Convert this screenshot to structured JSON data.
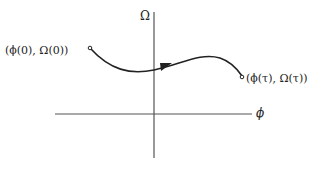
{
  "diagram": {
    "type": "phase-plane trajectory",
    "axes": {
      "x_label": "ϕ",
      "y_label": "Ω"
    },
    "start_point": {
      "label": "(ϕ(0), Ω(0))"
    },
    "end_point": {
      "label": "(ϕ(τ), Ω(τ))"
    },
    "arrow_direction": "from start to end (left to right)",
    "colors": {
      "ink": "#222222",
      "axis": "#555555",
      "background": "#ffffff"
    }
  }
}
